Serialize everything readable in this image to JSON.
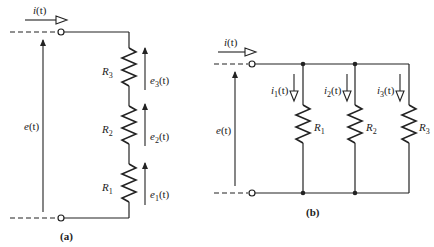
{
  "diagram_a": {
    "caption": "(a)",
    "source_current": "i(t)",
    "source_voltage": "e(t)",
    "resistors": [
      {
        "label": "R3",
        "sub": "3",
        "voltage": "e3(t)"
      },
      {
        "label": "R2",
        "sub": "2",
        "voltage": "e2(t)"
      },
      {
        "label": "R1",
        "sub": "1",
        "voltage": "e1(t)"
      }
    ],
    "connection": "series"
  },
  "diagram_b": {
    "caption": "(b)",
    "source_current": "i(t)",
    "source_voltage": "e(t)",
    "branches": [
      {
        "label": "R1",
        "sub": "1",
        "current": "i1(t)"
      },
      {
        "label": "R2",
        "sub": "2",
        "current": "i2(t)"
      },
      {
        "label": "R3",
        "sub": "3",
        "current": "i3(t)"
      }
    ],
    "connection": "parallel"
  },
  "text": {
    "R": "R",
    "e": "e",
    "i": "i",
    "t_suffix": "(t)",
    "s1": "1",
    "s2": "2",
    "s3": "3"
  }
}
